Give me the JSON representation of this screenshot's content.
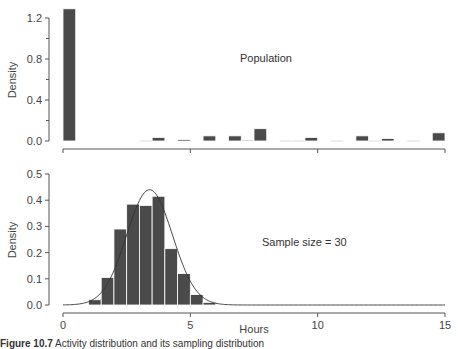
{
  "chart_data": [
    {
      "type": "bar",
      "panel": "top",
      "title": "",
      "annotation": "Population",
      "xlabel": "",
      "ylabel": "Density",
      "bin_width": 0.5,
      "xlim": [
        0,
        15
      ],
      "ylim": [
        0,
        1.3
      ],
      "yticks": [
        "0.0",
        "0.4",
        "0.8",
        "1.2"
      ],
      "ytick_values": [
        0.0,
        0.4,
        0.8,
        1.2
      ],
      "xticks": [
        "0",
        "5",
        "10",
        "15"
      ],
      "xtick_values": [
        0,
        5,
        10,
        15
      ],
      "bins": [
        {
          "x0": 0.0,
          "x1": 0.5,
          "density": 1.29
        },
        {
          "x0": 3.0,
          "x1": 3.5,
          "density": 0.005
        },
        {
          "x0": 3.5,
          "x1": 4.0,
          "density": 0.035
        },
        {
          "x0": 4.5,
          "x1": 5.0,
          "density": 0.015
        },
        {
          "x0": 5.5,
          "x1": 6.0,
          "density": 0.05
        },
        {
          "x0": 6.5,
          "x1": 7.0,
          "density": 0.05
        },
        {
          "x0": 7.0,
          "x1": 7.5,
          "density": 0.01
        },
        {
          "x0": 7.5,
          "x1": 8.0,
          "density": 0.12
        },
        {
          "x0": 8.5,
          "x1": 9.0,
          "density": 0.005
        },
        {
          "x0": 9.0,
          "x1": 9.5,
          "density": 0.005
        },
        {
          "x0": 9.5,
          "x1": 10.0,
          "density": 0.035
        },
        {
          "x0": 10.5,
          "x1": 11.0,
          "density": 0.005
        },
        {
          "x0": 11.5,
          "x1": 12.0,
          "density": 0.05
        },
        {
          "x0": 12.0,
          "x1": 12.5,
          "density": 0.005
        },
        {
          "x0": 12.5,
          "x1": 13.0,
          "density": 0.025
        },
        {
          "x0": 13.5,
          "x1": 14.0,
          "density": 0.005
        },
        {
          "x0": 14.5,
          "x1": 15.0,
          "density": 0.08
        }
      ],
      "grid": false
    },
    {
      "type": "bar",
      "panel": "bottom",
      "title": "",
      "annotation": "Sample size = 30",
      "xlabel": "Hours",
      "ylabel": "Density",
      "bin_width": 0.5,
      "xlim": [
        0,
        15
      ],
      "ylim": [
        0,
        0.5
      ],
      "yticks": [
        "0.0",
        "0.1",
        "0.2",
        "0.3",
        "0.4",
        "0.5"
      ],
      "ytick_values": [
        0.0,
        0.1,
        0.2,
        0.3,
        0.4,
        0.5
      ],
      "xticks": [
        "0",
        "5",
        "10",
        "15"
      ],
      "xtick_values": [
        0,
        5,
        10,
        15
      ],
      "bins": [
        {
          "x0": 1.0,
          "x1": 1.5,
          "density": 0.02
        },
        {
          "x0": 1.5,
          "x1": 2.0,
          "density": 0.105
        },
        {
          "x0": 2.0,
          "x1": 2.5,
          "density": 0.29
        },
        {
          "x0": 2.5,
          "x1": 3.0,
          "density": 0.385
        },
        {
          "x0": 3.0,
          "x1": 3.5,
          "density": 0.38
        },
        {
          "x0": 3.5,
          "x1": 4.0,
          "density": 0.415
        },
        {
          "x0": 4.0,
          "x1": 4.5,
          "density": 0.215
        },
        {
          "x0": 4.5,
          "x1": 5.0,
          "density": 0.12
        },
        {
          "x0": 5.0,
          "x1": 5.5,
          "density": 0.04
        },
        {
          "x0": 5.5,
          "x1": 6.0,
          "density": 0.01
        }
      ],
      "overlay_curve": {
        "type": "normal",
        "mean": 3.4,
        "sd": 0.9,
        "peak_density": 0.44
      },
      "grid": false
    }
  ],
  "figure": {
    "caption_label": "Figure 10.7",
    "caption_text": "Activity distribution and its sampling distribution"
  },
  "colors": {
    "bar_fill": "#4a4a4a",
    "bar_edge": "#ffffff",
    "axis": "#555555",
    "curve": "#333333"
  }
}
